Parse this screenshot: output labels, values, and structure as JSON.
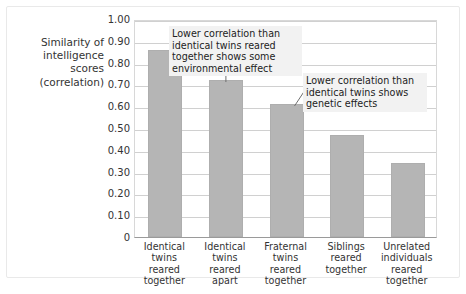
{
  "chart_data": {
    "type": "bar",
    "title": "",
    "subtitle": "",
    "xlabel": "",
    "ylabel": "Similarity of\nintelligence\nscores\n(correlation)",
    "categories": [
      "Identical\ntwins\nreared\ntogether",
      "Identical\ntwins\nreared\napart",
      "Fraternal\ntwins\nreared\ntogether",
      "Siblings\nreared\ntogether",
      "Unrelated\nindividuals\nreared\ntogether"
    ],
    "values": [
      0.86,
      0.72,
      0.61,
      0.47,
      0.34
    ],
    "ylim": [
      0,
      1.0
    ],
    "ytick_labels": [
      "1.00",
      "0.90",
      "0.80",
      "0.70",
      "0.60",
      "0.50",
      "0.40",
      "0.30",
      "0.20",
      "0.10",
      "0"
    ],
    "ytick_values": [
      1.0,
      0.9,
      0.8,
      0.7,
      0.6,
      0.5,
      0.4,
      0.3,
      0.2,
      0.1,
      0
    ],
    "grid": true,
    "legend": "none",
    "bar_color": "#b5b5b5",
    "annotations": [
      {
        "id": "annotation-1",
        "text": "Lower correlation than\nidentical twins reared\ntogether shows some\nenvironmental effect",
        "target_category": "Identical twins reared apart",
        "leader": "vertical"
      },
      {
        "id": "annotation-2",
        "text": "Lower correlation than\nidentical twins shows\ngenetic effects",
        "target_category": "Fraternal twins reared together",
        "leader": "diagonal"
      }
    ]
  }
}
